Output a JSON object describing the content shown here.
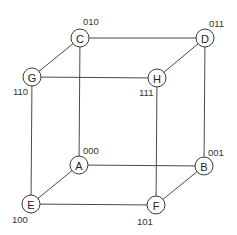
{
  "diagram": {
    "type": "cube-graph",
    "nodes": [
      {
        "id": "C",
        "label": "C",
        "code": "010",
        "x": 80,
        "y": 38,
        "code_x": 83,
        "code_y": 25
      },
      {
        "id": "D",
        "label": "D",
        "code": "011",
        "x": 205,
        "y": 38,
        "code_x": 209,
        "code_y": 27
      },
      {
        "id": "G",
        "label": "G",
        "code": "110",
        "x": 32,
        "y": 77,
        "code_x": 13,
        "code_y": 95
      },
      {
        "id": "H",
        "label": "H",
        "code": "111",
        "x": 157,
        "y": 78,
        "code_x": 139,
        "code_y": 96
      },
      {
        "id": "A",
        "label": "A",
        "code": "000",
        "x": 79,
        "y": 165,
        "code_x": 83,
        "code_y": 154
      },
      {
        "id": "B",
        "label": "B",
        "code": "001",
        "x": 204,
        "y": 166,
        "code_x": 208,
        "code_y": 156
      },
      {
        "id": "E",
        "label": "E",
        "code": "100",
        "x": 31,
        "y": 204,
        "code_x": 12,
        "code_y": 223
      },
      {
        "id": "F",
        "label": "F",
        "code": "101",
        "x": 156,
        "y": 205,
        "code_x": 137,
        "code_y": 225
      }
    ],
    "edges": [
      [
        "C",
        "D"
      ],
      [
        "G",
        "H"
      ],
      [
        "C",
        "G"
      ],
      [
        "D",
        "H"
      ],
      [
        "A",
        "B"
      ],
      [
        "E",
        "F"
      ],
      [
        "A",
        "E"
      ],
      [
        "B",
        "F"
      ],
      [
        "C",
        "A"
      ],
      [
        "D",
        "B"
      ],
      [
        "G",
        "E"
      ],
      [
        "H",
        "F"
      ]
    ],
    "colors": {
      "line": "#4a4a4a",
      "node_fill": "#ffffff",
      "text": "#222222"
    },
    "node_radius": 9
  }
}
